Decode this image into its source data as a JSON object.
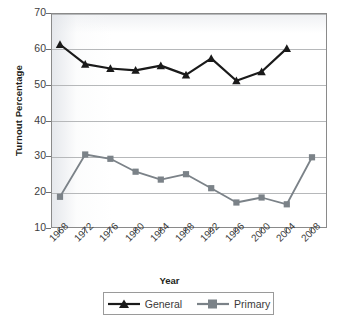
{
  "chart_data": {
    "type": "line",
    "title": "",
    "xlabel": "Year",
    "ylabel": "Turnout Percentage",
    "categories": [
      "1968",
      "1972",
      "1976",
      "1980",
      "1984",
      "1988",
      "1992",
      "1996",
      "2000",
      "2004",
      "2008"
    ],
    "x_tick_labels": [
      "1968",
      "1972",
      "1976",
      "1980",
      "1984",
      "1988",
      "1992",
      "1996",
      "2000",
      "2004",
      "2008"
    ],
    "y_tick_labels": [
      "70",
      "60",
      "50",
      "40",
      "30",
      "20",
      "10"
    ],
    "ylim": [
      10,
      70
    ],
    "y_tick_step": 10,
    "grid": "horizontal",
    "legend_position": "bottom",
    "series": [
      {
        "name": "General",
        "color": "#1a1a1a",
        "marker": "triangle",
        "values": [
          61.5,
          56.0,
          54.8,
          54.3,
          55.6,
          53.0,
          57.6,
          51.4,
          53.9,
          60.4,
          null
        ]
      },
      {
        "name": "Primary",
        "color": "#7b8288",
        "marker": "square",
        "values": [
          19.0,
          30.8,
          29.6,
          26.0,
          23.8,
          25.3,
          21.4,
          17.4,
          18.8,
          16.9,
          30.0
        ]
      }
    ]
  },
  "legend": {
    "items": [
      {
        "label": "General"
      },
      {
        "label": "Primary"
      }
    ]
  }
}
